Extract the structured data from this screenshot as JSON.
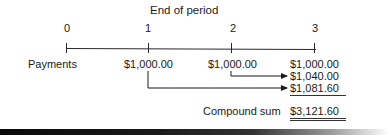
{
  "diagram": {
    "title": "End of period",
    "periods": [
      "0",
      "1",
      "2",
      "3"
    ],
    "row_label": "Payments",
    "payments": [
      "$1,000.00",
      "$1,000.00",
      "$1,000.00"
    ],
    "future_values": [
      "$1,000.00",
      "$1,040.00",
      "$1,081.60"
    ],
    "total_label": "Compound sum",
    "total_value": "$3,121.60",
    "colors": {
      "ink": "#1a1a1a",
      "background": "#ffffff"
    }
  }
}
